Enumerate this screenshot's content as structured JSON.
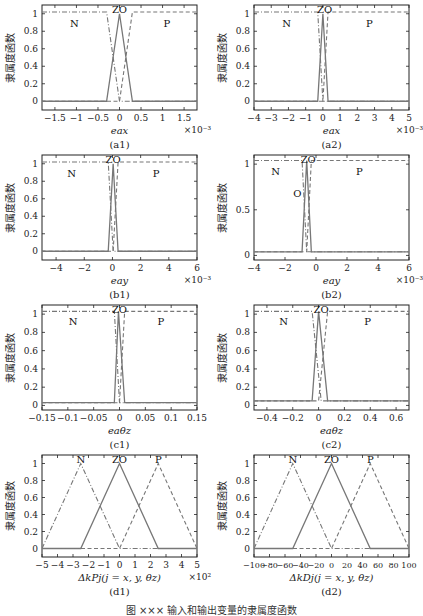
{
  "figure": {
    "caption": "图 ×××  输入和输出变量的隶属度函数"
  },
  "chart_data": [
    {
      "id": "a1",
      "type": "line",
      "sublabel": "(a1)",
      "xlabel": "e_a^x",
      "ylabel": "隶属度函数",
      "x_multiplier": "×10⁻³",
      "xlim": [
        -1.8,
        1.8
      ],
      "ylim": [
        -0.1,
        1.1
      ],
      "xticks": [
        -1.5,
        -1,
        -0.5,
        0,
        0.5,
        1,
        1.5
      ],
      "xtick_labels": [
        "−1.5",
        "−1",
        "−0.5",
        "0",
        "0.5",
        "1",
        "1.5"
      ],
      "yticks": [
        0,
        0.2,
        0.4,
        0.6,
        0.8,
        1
      ],
      "ytick_labels": [
        "0",
        "0.2",
        "0.4",
        "0.6",
        "0.8",
        "1"
      ],
      "series": [
        {
          "name": "N",
          "style": "dashdot",
          "x": [
            -1.8,
            -0.3,
            0,
            1.8
          ],
          "y": [
            1.02,
            1.02,
            0,
            0
          ]
        },
        {
          "name": "ZO",
          "style": "solid",
          "x": [
            -1.8,
            -0.3,
            0,
            0.3,
            1.8
          ],
          "y": [
            0,
            0,
            1,
            0,
            0
          ]
        },
        {
          "name": "P",
          "style": "dashed",
          "x": [
            -1.8,
            0,
            0.3,
            1.8
          ],
          "y": [
            0,
            0,
            1.02,
            1.02
          ]
        }
      ],
      "labels": [
        {
          "text": "N",
          "x": -1.05,
          "y": 0.9
        },
        {
          "text": "ZO",
          "x": 0,
          "y": 1.05
        },
        {
          "text": "P",
          "x": 1.1,
          "y": 0.9
        }
      ]
    },
    {
      "id": "a2",
      "type": "line",
      "sublabel": "(a2)",
      "xlabel": "e_a^x",
      "ylabel": "隶属度函数",
      "x_multiplier": "×10⁻³",
      "xlim": [
        -4,
        5
      ],
      "ylim": [
        -0.1,
        1.1
      ],
      "xticks": [
        -4,
        -3,
        -2,
        -1,
        0,
        1,
        2,
        3,
        4,
        5
      ],
      "xtick_labels": [
        "−4",
        "−3",
        "−2",
        "−1",
        "0",
        "1",
        "2",
        "3",
        "4",
        "5"
      ],
      "yticks": [
        0,
        0.2,
        0.4,
        0.6,
        0.8,
        1
      ],
      "ytick_labels": [
        "0",
        "0.2",
        "0.4",
        "0.6",
        "0.8",
        "1"
      ],
      "series": [
        {
          "name": "N",
          "style": "dashdot",
          "x": [
            -4,
            -0.3,
            0,
            5
          ],
          "y": [
            1.02,
            1.02,
            0,
            0
          ]
        },
        {
          "name": "ZO",
          "style": "solid",
          "x": [
            -4,
            -0.3,
            0,
            0.3,
            5
          ],
          "y": [
            0,
            0,
            1,
            0,
            0
          ]
        },
        {
          "name": "P",
          "style": "dashed",
          "x": [
            -4,
            0,
            0.3,
            5
          ],
          "y": [
            0,
            0,
            1.02,
            1.02
          ]
        }
      ],
      "labels": [
        {
          "text": "N",
          "x": -2.1,
          "y": 0.9
        },
        {
          "text": "ZO",
          "x": 0.1,
          "y": 1.05
        },
        {
          "text": "P",
          "x": 2.7,
          "y": 0.9
        }
      ]
    },
    {
      "id": "b1",
      "type": "line",
      "sublabel": "(b1)",
      "xlabel": "e_a^y",
      "ylabel": "隶属度函数",
      "x_multiplier": "×10⁻³",
      "xlim": [
        -5,
        6
      ],
      "ylim": [
        -0.1,
        1.1
      ],
      "xticks": [
        -4,
        -2,
        0,
        2,
        4,
        6
      ],
      "xtick_labels": [
        "−4",
        "−2",
        "0",
        "2",
        "4",
        "6"
      ],
      "yticks": [
        0,
        0.2,
        0.4,
        0.6,
        0.8,
        1
      ],
      "ytick_labels": [
        "0",
        "0.2",
        "0.4",
        "0.6",
        "0.8",
        "1"
      ],
      "series": [
        {
          "name": "N",
          "style": "dashdot",
          "x": [
            -5,
            -0.3,
            0.05,
            6
          ],
          "y": [
            1.02,
            1.02,
            0,
            0
          ]
        },
        {
          "name": "ZO",
          "style": "solid",
          "x": [
            -5,
            -0.3,
            0.05,
            0.4,
            6
          ],
          "y": [
            0,
            0,
            1,
            0,
            0
          ]
        },
        {
          "name": "P",
          "style": "dashed",
          "x": [
            -5,
            0.05,
            0.4,
            6
          ],
          "y": [
            0,
            0,
            1.02,
            1.02
          ]
        }
      ],
      "labels": [
        {
          "text": "N",
          "x": -2.9,
          "y": 0.9
        },
        {
          "text": "ZO",
          "x": 0.05,
          "y": 1.05
        },
        {
          "text": "P",
          "x": 3.1,
          "y": 0.9
        }
      ]
    },
    {
      "id": "b2",
      "type": "line",
      "sublabel": "(b2)",
      "xlabel": "e_a^y",
      "ylabel": "隶属度函数",
      "x_multiplier": "×10⁻³",
      "xlim": [
        -4,
        6
      ],
      "ylim": [
        -0.05,
        1.1
      ],
      "xticks": [
        -4,
        -2,
        0,
        2,
        4,
        6
      ],
      "xtick_labels": [
        "−4",
        "−2",
        "0",
        "2",
        "4",
        "6"
      ],
      "yticks": [
        0,
        0.5,
        1
      ],
      "ytick_labels": [
        "0",
        "0.5",
        "1"
      ],
      "series": [
        {
          "name": "N",
          "style": "dashdot",
          "x": [
            -4,
            -0.9,
            -0.6,
            6
          ],
          "y": [
            1.04,
            1.04,
            0.04,
            0.04
          ]
        },
        {
          "name": "ZO",
          "style": "solid",
          "x": [
            -4,
            -0.9,
            -0.6,
            -0.3,
            6
          ],
          "y": [
            0.04,
            0.04,
            1.04,
            0.04,
            0.04
          ]
        },
        {
          "name": "P",
          "style": "dashed",
          "x": [
            -4,
            -0.6,
            -0.3,
            6
          ],
          "y": [
            0.04,
            0.04,
            1.04,
            1.04
          ]
        }
      ],
      "labels": [
        {
          "text": "N",
          "x": -2.6,
          "y": 0.92
        },
        {
          "text": "ZO",
          "x": -0.5,
          "y": 1.06
        },
        {
          "text": "P",
          "x": 2.8,
          "y": 0.92
        },
        {
          "text": "O",
          "x": -1.2,
          "y": 0.68
        }
      ]
    },
    {
      "id": "c1",
      "type": "line",
      "sublabel": "(c1)",
      "xlabel": "e_a^θz",
      "ylabel": "隶属度函数",
      "x_multiplier": "",
      "xlim": [
        -0.15,
        0.15
      ],
      "ylim": [
        -0.05,
        1.1
      ],
      "xticks": [
        -0.15,
        -0.1,
        -0.05,
        0,
        0.05,
        0.1,
        0.15
      ],
      "xtick_labels": [
        "−0.15",
        "−0.1",
        "−0.05",
        "0",
        "0.05",
        "0.1",
        "0.15"
      ],
      "yticks": [
        0,
        0.2,
        0.4,
        0.6,
        0.8,
        1
      ],
      "ytick_labels": [
        "0",
        "0.2",
        "0.4",
        "0.6",
        "0.8",
        "1"
      ],
      "series": [
        {
          "name": "N",
          "style": "dashdot",
          "x": [
            -0.15,
            -0.01,
            0,
            0.15
          ],
          "y": [
            1.03,
            1.03,
            0.03,
            0.03
          ]
        },
        {
          "name": "ZO",
          "style": "solid",
          "x": [
            -0.15,
            -0.01,
            -0.002,
            0.01,
            0.15
          ],
          "y": [
            0.03,
            0.03,
            1.03,
            0.03,
            0.03
          ]
        },
        {
          "name": "P",
          "style": "dashed",
          "x": [
            -0.15,
            0,
            0.01,
            0.15
          ],
          "y": [
            0.03,
            0.03,
            1.03,
            1.03
          ]
        }
      ],
      "labels": [
        {
          "text": "N",
          "x": -0.09,
          "y": 0.92
        },
        {
          "text": "ZO",
          "x": 0,
          "y": 1.06
        },
        {
          "text": "P",
          "x": 0.08,
          "y": 0.92
        }
      ]
    },
    {
      "id": "c2",
      "type": "line",
      "sublabel": "(c2)",
      "xlabel": "e_a^θz",
      "ylabel": "隶属度函数",
      "x_multiplier": "",
      "xlim": [
        -0.5,
        0.7
      ],
      "ylim": [
        -0.05,
        1.1
      ],
      "xticks": [
        -0.4,
        -0.2,
        0,
        0.2,
        0.4,
        0.6
      ],
      "xtick_labels": [
        "−0.4",
        "−0.2",
        "0",
        "0.2",
        "0.4",
        "0.6"
      ],
      "yticks": [
        0,
        0.2,
        0.4,
        0.6,
        0.8,
        1
      ],
      "ytick_labels": [
        "0",
        "0.2",
        "0.4",
        "0.6",
        "0.8",
        "1"
      ],
      "series": [
        {
          "name": "N",
          "style": "dashdot",
          "x": [
            -0.5,
            -0.05,
            0.02,
            0.7
          ],
          "y": [
            1.03,
            1.03,
            0.05,
            0.05
          ]
        },
        {
          "name": "ZO",
          "style": "solid",
          "x": [
            -0.5,
            -0.05,
            0,
            0.07,
            0.7
          ],
          "y": [
            0.05,
            0.05,
            1.03,
            0.05,
            0.05
          ]
        },
        {
          "name": "P",
          "style": "dashed",
          "x": [
            -0.5,
            0,
            0.07,
            0.7
          ],
          "y": [
            0.05,
            0.05,
            1.03,
            1.03
          ]
        }
      ],
      "labels": [
        {
          "text": "N",
          "x": -0.27,
          "y": 0.92
        },
        {
          "text": "ZO",
          "x": 0.02,
          "y": 1.06
        },
        {
          "text": "P",
          "x": 0.38,
          "y": 0.92
        }
      ]
    },
    {
      "id": "d1",
      "type": "line",
      "sublabel": "(d1)",
      "xlabel": "Δk_P^j(j = x, y, θz)",
      "ylabel": "隶属度函数",
      "x_multiplier": "×10²",
      "xlim": [
        -5,
        5
      ],
      "ylim": [
        -0.1,
        1.1
      ],
      "xticks": [
        -5,
        -4,
        -3,
        -2,
        -1,
        0,
        1,
        2,
        3,
        4,
        5
      ],
      "xtick_labels": [
        "−5",
        "−4",
        "−3",
        "−2",
        "−1",
        "0",
        "1",
        "2",
        "3",
        "4",
        "5"
      ],
      "yticks": [
        0,
        0.2,
        0.4,
        0.6,
        0.8,
        1
      ],
      "ytick_labels": [
        "0",
        "0.2",
        "0.4",
        "0.6",
        "0.8",
        "1"
      ],
      "series": [
        {
          "name": "N",
          "style": "dashdot",
          "x": [
            -5,
            -2.5,
            0,
            5
          ],
          "y": [
            0,
            1,
            0,
            0
          ]
        },
        {
          "name": "ZO",
          "style": "solid",
          "x": [
            -5,
            -2.5,
            0,
            2.5,
            5
          ],
          "y": [
            0,
            0,
            1,
            0,
            0
          ]
        },
        {
          "name": "P",
          "style": "dashed",
          "x": [
            -5,
            0,
            2.5,
            5
          ],
          "y": [
            0,
            0,
            1,
            0
          ]
        }
      ],
      "labels": [
        {
          "text": "N",
          "x": -2.5,
          "y": 1.05
        },
        {
          "text": "ZO",
          "x": 0,
          "y": 1.05
        },
        {
          "text": "P",
          "x": 2.5,
          "y": 1.05
        }
      ]
    },
    {
      "id": "d2",
      "type": "line",
      "sublabel": "(d2)",
      "xlabel": "Δk_D^j(j = x, y, θz)",
      "ylabel": "隶属度函数",
      "x_multiplier": "",
      "xlim": [
        -100,
        100
      ],
      "ylim": [
        -0.1,
        1.1
      ],
      "xticks": [
        -100,
        -80,
        -60,
        -40,
        -20,
        0,
        20,
        40,
        60,
        80,
        100
      ],
      "xtick_labels": [
        "−100",
        "−80",
        "−60",
        "−40",
        "−20",
        "0",
        "20",
        "40",
        "60",
        "80",
        "100"
      ],
      "yticks": [
        0,
        0.2,
        0.4,
        0.6,
        0.8,
        1
      ],
      "ytick_labels": [
        "0",
        "0.2",
        "0.4",
        "0.6",
        "0.8",
        "1"
      ],
      "series": [
        {
          "name": "N",
          "style": "dashdot",
          "x": [
            -100,
            -50,
            0,
            100
          ],
          "y": [
            0,
            1,
            0,
            0
          ]
        },
        {
          "name": "ZO",
          "style": "solid",
          "x": [
            -100,
            -50,
            0,
            50,
            100
          ],
          "y": [
            0,
            0,
            1,
            0,
            0
          ]
        },
        {
          "name": "P",
          "style": "dashed",
          "x": [
            -100,
            0,
            50,
            100
          ],
          "y": [
            0,
            0,
            1,
            0
          ]
        }
      ],
      "labels": [
        {
          "text": "N",
          "x": -50,
          "y": 1.05
        },
        {
          "text": "ZO",
          "x": 0,
          "y": 1.05
        },
        {
          "text": "P",
          "x": 50,
          "y": 1.05
        }
      ]
    }
  ]
}
